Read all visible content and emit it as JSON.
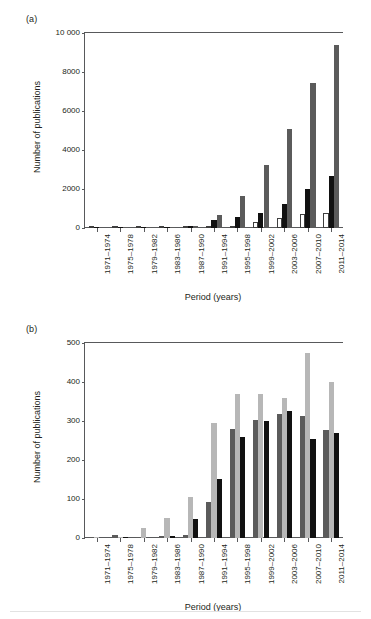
{
  "figure": {
    "panels": [
      {
        "tag": "(a)",
        "name": "panel-a",
        "chart_index": 0
      },
      {
        "tag": "(b)",
        "name": "panel-b",
        "chart_index": 1
      }
    ]
  },
  "chart_data": [
    {
      "type": "bar",
      "title": "(a)",
      "xlabel": "Period (years)",
      "ylabel": "Number of publications",
      "ylim": [
        0,
        10000
      ],
      "yticks": [
        0,
        2000,
        4000,
        6000,
        8000,
        10000
      ],
      "ytick_labels": [
        "0",
        "2000",
        "4000",
        "6000",
        "8000",
        "10 000"
      ],
      "grid": false,
      "legend": "none",
      "categories": [
        "1971–1974",
        "1975–1978",
        "1979–1982",
        "1983–1986",
        "1987–1990",
        "1991–1994",
        "1995–1998",
        "1999–2002",
        "2003–2006",
        "2007–2010",
        "2011–2014"
      ],
      "series": [
        {
          "name": "series-1",
          "style": "white-outlined",
          "color": "#ffffff",
          "edge_color": "#3f3f3f",
          "values": [
            0,
            0,
            0,
            0,
            10,
            20,
            120,
            330,
            500,
            710,
            770
          ]
        },
        {
          "name": "series-2",
          "style": "black",
          "color": "#111111",
          "values": [
            2,
            10,
            12,
            30,
            120,
            400,
            560,
            790,
            1250,
            2000,
            2670
          ]
        },
        {
          "name": "series-3",
          "style": "dark-gray",
          "color": "#5b5b5b",
          "values": [
            0,
            2,
            5,
            10,
            110,
            650,
            1630,
            3220,
            5090,
            7420,
            9400
          ]
        }
      ]
    },
    {
      "type": "bar",
      "title": "(b)",
      "xlabel": "Period (years)",
      "ylabel": "Number of publications",
      "ylim": [
        0,
        500
      ],
      "yticks": [
        0,
        100,
        200,
        300,
        400,
        500
      ],
      "ytick_labels": [
        "0",
        "100",
        "200",
        "300",
        "400",
        "500"
      ],
      "grid": false,
      "legend": "none",
      "categories": [
        "1971–1974",
        "1975–1978",
        "1979–1982",
        "1983–1986",
        "1987–1990",
        "1991–1994",
        "1995–1998",
        "1999–2002",
        "2003–2006",
        "2007–2010",
        "2011–2014"
      ],
      "series": [
        {
          "name": "series-1",
          "style": "dark-gray",
          "color": "#5b5b5b",
          "values": [
            1,
            7,
            1,
            6,
            9,
            93,
            280,
            303,
            318,
            313,
            276
          ]
        },
        {
          "name": "series-2",
          "style": "light-gray",
          "color": "#b7b7b7",
          "values": [
            1,
            3,
            25,
            52,
            104,
            296,
            369,
            369,
            358,
            475,
            401
          ]
        },
        {
          "name": "series-3",
          "style": "black",
          "color": "#111111",
          "values": [
            0,
            1,
            0,
            5,
            50,
            152,
            258,
            300,
            325,
            254,
            270
          ]
        }
      ]
    }
  ]
}
